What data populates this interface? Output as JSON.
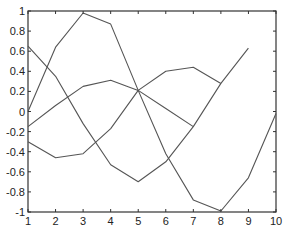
{
  "chart_data": {
    "type": "line",
    "title": "",
    "xlabel": "",
    "ylabel": "",
    "xlim": [
      1,
      10
    ],
    "ylim": [
      -1,
      1
    ],
    "grid": false,
    "legend": null,
    "x_ticks": [
      "1",
      "2",
      "3",
      "4",
      "5",
      "6",
      "7",
      "8",
      "9",
      "10"
    ],
    "y_ticks": [
      "1",
      "0.8",
      "0.6",
      "0.4",
      "0.2",
      "0",
      "-0.2",
      "-0.4",
      "-0.6",
      "-0.8",
      "-1"
    ],
    "series": [
      {
        "name": "series-1",
        "x": [
          1,
          2,
          3,
          4,
          5,
          6,
          7,
          8,
          9,
          10
        ],
        "values": [
          0.0,
          0.64,
          0.98,
          0.87,
          0.21,
          -0.42,
          -0.88,
          -0.99,
          -0.66,
          -0.02
        ],
        "color": "#555555"
      },
      {
        "name": "series-2",
        "x": [
          1,
          2,
          3,
          4,
          5,
          6,
          7,
          8,
          9
        ],
        "values": [
          0.65,
          0.35,
          -0.12,
          -0.53,
          -0.7,
          -0.5,
          -0.15,
          0.28,
          0.63
        ],
        "color": "#555555"
      },
      {
        "name": "series-3",
        "x": [
          1,
          2,
          3,
          4,
          5,
          6,
          7,
          8
        ],
        "values": [
          -0.15,
          0.06,
          0.25,
          0.31,
          0.21,
          0.4,
          0.44,
          0.28
        ],
        "color": "#555555"
      },
      {
        "name": "series-4",
        "x": [
          1,
          2,
          3,
          4,
          5,
          6,
          7
        ],
        "values": [
          -0.3,
          -0.46,
          -0.42,
          -0.17,
          0.21,
          0.03,
          -0.15
        ],
        "color": "#555555"
      }
    ]
  },
  "layout": {
    "plot_left": 28,
    "plot_right": 276,
    "plot_top": 11,
    "plot_bottom": 212
  }
}
